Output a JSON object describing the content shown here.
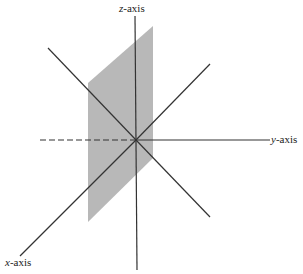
{
  "diagram": {
    "type": "3d-coordinate-axes",
    "labels": {
      "z": {
        "var": "z",
        "suffix": "-axis"
      },
      "y": {
        "var": "y",
        "suffix": "-axis"
      },
      "x": {
        "var": "x",
        "suffix": "-axis"
      }
    },
    "colors": {
      "axis": "#333333",
      "plane": "#b8b8b8",
      "background": "#ffffff"
    },
    "origin": [
      136,
      140
    ],
    "axes": {
      "z_axis": {
        "from": [
          135,
          16
        ],
        "to": [
          137,
          270
        ]
      },
      "y_axis": {
        "from": [
          136,
          140
        ],
        "to": [
          270,
          140
        ]
      },
      "y_axis_negative_dashed": {
        "from": [
          40,
          140
        ],
        "to": [
          136,
          140
        ]
      },
      "x_axis": {
        "from": [
          136,
          140
        ],
        "to": [
          20,
          256
        ]
      },
      "diagonal_upper_left": {
        "from": [
          48,
          48
        ],
        "to": [
          136,
          140
        ]
      },
      "diagonal_upper_right": {
        "from": [
          136,
          140
        ],
        "to": [
          210,
          64
        ]
      },
      "diagonal_lower_right": {
        "from": [
          136,
          140
        ],
        "to": [
          210,
          217
        ]
      }
    },
    "plane": {
      "points": [
        [
          153,
          26
        ],
        [
          153,
          158
        ],
        [
          88,
          222
        ],
        [
          88,
          83
        ]
      ]
    }
  }
}
